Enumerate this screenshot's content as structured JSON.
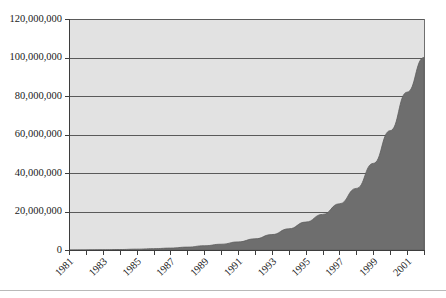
{
  "chart_data": {
    "type": "area",
    "title": "",
    "subtitle": "",
    "xlabel": "",
    "ylabel": "",
    "legend": [],
    "grid": true,
    "legend_position": "none",
    "xlim": [
      1981,
      2002
    ],
    "ylim": [
      0,
      120000000
    ],
    "y_ticks": [
      0,
      20000000,
      40000000,
      60000000,
      80000000,
      100000000,
      120000000
    ],
    "y_tick_labels": [
      "0",
      "20,000,000",
      "40,000,000",
      "60,000,000",
      "80,000,000",
      "100,000,000",
      "120,000,000"
    ],
    "x_ticks": [
      1981,
      1982,
      1983,
      1984,
      1985,
      1986,
      1987,
      1988,
      1989,
      1990,
      1991,
      1992,
      1993,
      1994,
      1995,
      1996,
      1997,
      1998,
      1999,
      2000,
      2001,
      2002
    ],
    "x_tick_labels": [
      "1981",
      "1983",
      "1985",
      "1987",
      "1989",
      "1991",
      "1993",
      "1995",
      "1997",
      "1999",
      "2001"
    ],
    "x_tick_label_years": [
      1981,
      1983,
      1985,
      1987,
      1989,
      1991,
      1993,
      1995,
      1997,
      1999,
      2001
    ],
    "x_tick_label_rotation": -45,
    "x": [
      1981,
      1982,
      1983,
      1984,
      1985,
      1986,
      1987,
      1988,
      1989,
      1990,
      1991,
      1992,
      1993,
      1994,
      1995,
      1996,
      1997,
      1998,
      1999,
      2000,
      2001,
      2002
    ],
    "values": [
      0,
      50000,
      120000,
      250000,
      450000,
      700000,
      1000000,
      1500000,
      2200000,
      3000000,
      4200000,
      5800000,
      8000000,
      11000000,
      14500000,
      18500000,
      24000000,
      32000000,
      45000000,
      62000000,
      82000000,
      100000000
    ],
    "series": [
      {
        "name": "Total",
        "values": [
          0,
          50000,
          120000,
          250000,
          450000,
          700000,
          1000000,
          1500000,
          2200000,
          3000000,
          4200000,
          5800000,
          8000000,
          11000000,
          14500000,
          18500000,
          24000000,
          32000000,
          45000000,
          62000000,
          82000000,
          100000000
        ]
      }
    ],
    "colors": {
      "area_fill": "#6e6e6e",
      "plot_background": "#e2e2e2",
      "gridline": "#5a5a5a",
      "axis": "#3d3d3d",
      "text": "#1a1a1a",
      "page_background": "#ffffff"
    }
  }
}
